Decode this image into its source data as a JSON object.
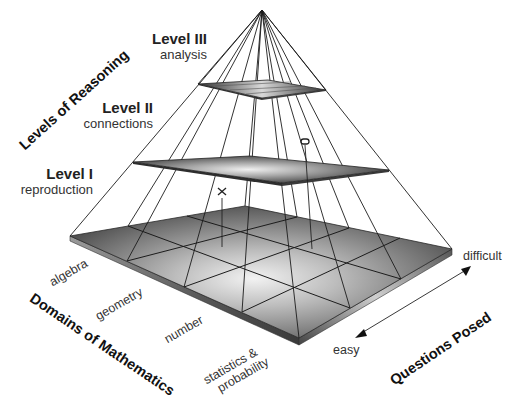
{
  "diagram": {
    "type": "pyramid",
    "axes": {
      "vertical_title": "Levels of Reasoning",
      "left_title": "Domains of Mathematics",
      "right_title": "Questions Posed"
    },
    "levels": [
      {
        "name": "Level III",
        "description": "analysis"
      },
      {
        "name": "Level II",
        "description": "connections"
      },
      {
        "name": "Level I",
        "description": "reproduction"
      }
    ],
    "domains": [
      "algebra",
      "geometry",
      "number",
      "statistics &",
      "probability"
    ],
    "difficulty": {
      "low": "easy",
      "high": "difficult"
    },
    "markers": [
      {
        "symbol": "x",
        "label": "x"
      },
      {
        "symbol": "o",
        "label": "o"
      }
    ],
    "colors": {
      "plane_dark": "#3c3c3c",
      "plane_light": "#e8e8e8",
      "line": "#1a1a1a"
    }
  }
}
